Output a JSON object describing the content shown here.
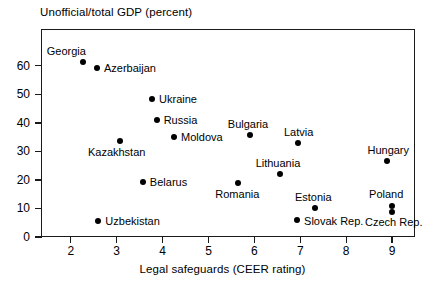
{
  "chart_data": {
    "type": "scatter",
    "title": "Unofficial/total GDP (percent)",
    "xlabel": "Legal safeguards (CEER rating)",
    "ylabel": "Unofficial/total GDP (percent)",
    "xlim": [
      1.35,
      9.5
    ],
    "ylim": [
      0,
      72.9
    ],
    "grid": false,
    "legend": "none",
    "xticks": [
      2,
      3,
      4,
      5,
      6,
      7,
      8,
      9
    ],
    "yticks": [
      0,
      10,
      20,
      30,
      40,
      50,
      60
    ],
    "xtick_labels": [
      "2",
      "3",
      "4",
      "5",
      "6",
      "7",
      "8",
      "9"
    ],
    "ytick_labels": [
      "0",
      "10",
      "20",
      "30",
      "40",
      "50",
      "60"
    ],
    "points": [
      {
        "label": "Georgia",
        "x": 2.26,
        "y": 61.5,
        "label_dx": -36,
        "label_dy": -16
      },
      {
        "label": "Azerbaijan",
        "x": 2.57,
        "y": 59.3,
        "label_dx": 7,
        "label_dy": -5
      },
      {
        "label": "Ukraine",
        "x": 3.77,
        "y": 48.4,
        "label_dx": 7,
        "label_dy": -5
      },
      {
        "label": "Russia",
        "x": 3.87,
        "y": 41.1,
        "label_dx": 7,
        "label_dy": -5
      },
      {
        "label": "Moldova",
        "x": 4.25,
        "y": 35.1,
        "label_dx": 7,
        "label_dy": -5
      },
      {
        "label": "Kazakhstan",
        "x": 3.07,
        "y": 33.7,
        "label_dx": -32,
        "label_dy": 6
      },
      {
        "label": "Bulgaria",
        "x": 5.9,
        "y": 35.8,
        "label_dx": -22,
        "label_dy": -16
      },
      {
        "label": "Latvia",
        "x": 6.95,
        "y": 33.0,
        "label_dx": -14,
        "label_dy": -16
      },
      {
        "label": "Hungary",
        "x": 8.9,
        "y": 26.7,
        "label_dx": -20,
        "label_dy": -16
      },
      {
        "label": "Lithuania",
        "x": 6.55,
        "y": 22.1,
        "label_dx": -24,
        "label_dy": -16
      },
      {
        "label": "Belarus",
        "x": 3.57,
        "y": 19.3,
        "label_dx": 7,
        "label_dy": -5
      },
      {
        "label": "Romania",
        "x": 5.65,
        "y": 18.9,
        "label_dx": -23,
        "label_dy": 6
      },
      {
        "label": "Poland",
        "x": 9.0,
        "y": 10.9,
        "label_dx": -23,
        "label_dy": -17
      },
      {
        "label": "Estonia",
        "x": 7.32,
        "y": 10.2,
        "label_dx": -20,
        "label_dy": -16
      },
      {
        "label": "Czech Rep.",
        "x": 9.0,
        "y": 8.8,
        "label_dx": -27,
        "label_dy": 5
      },
      {
        "label": "Slovak Rep.",
        "x": 6.93,
        "y": 6.0,
        "label_dx": 7,
        "label_dy": -4
      },
      {
        "label": "Uzbekistan",
        "x": 2.6,
        "y": 5.6,
        "label_dx": 7,
        "label_dy": -5
      }
    ]
  }
}
